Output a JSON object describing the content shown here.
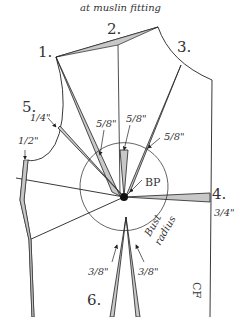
{
  "caption": "at muslin fitting",
  "colors": {
    "line": "#222222",
    "dart_fill": "#c8c8c8",
    "text": "#333333"
  },
  "labels": {
    "point_1": "1.",
    "point_2": "2.",
    "point_3": "3.",
    "point_4": "4.",
    "point_5": "5.",
    "point_6": "6.",
    "bp": "BP",
    "bust": "Bust",
    "radius": "radius",
    "cf": "CF"
  },
  "measurements": {
    "m_1_4": "1/4\"",
    "m_1_2": "1/2\"",
    "m_5_8_a": "5/8\"",
    "m_5_8_b": "5/8\"",
    "m_5_8_c": "5/8\"",
    "m_3_4": "3/4\"",
    "m_3_8_a": "3/8\"",
    "m_3_8_b": "3/8\""
  }
}
